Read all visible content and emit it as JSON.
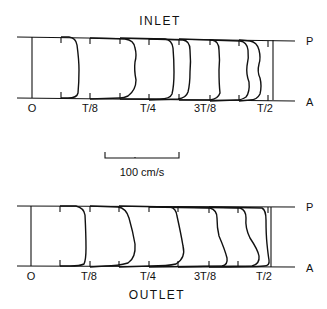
{
  "figure": {
    "scale_bar": {
      "label": "100 cm/s"
    },
    "panels": [
      {
        "title": "INLET",
        "top_label": "P",
        "bottom_label": "A",
        "time_labels": [
          "O",
          "T/8",
          "T/4",
          "3T/8",
          "T/2"
        ]
      },
      {
        "title": "OUTLET",
        "top_label": "P",
        "bottom_label": "A",
        "time_labels": [
          "O",
          "T/8",
          "T/4",
          "3T/8",
          "T/2"
        ]
      }
    ]
  }
}
